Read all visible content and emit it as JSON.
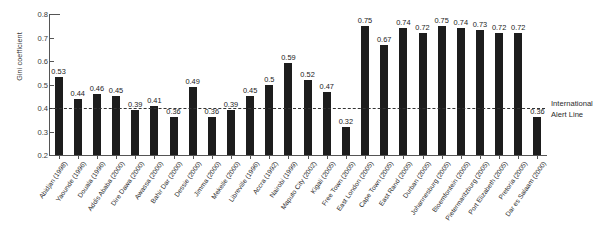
{
  "chart_data": {
    "type": "bar",
    "title": "",
    "xlabel": "",
    "ylabel": "Gini coefficient",
    "ylim": [
      0.2,
      0.8
    ],
    "ytick_labels": [
      "0.8",
      "0.7",
      "0.6",
      "0.5",
      "0.4",
      "0.3",
      "0.2"
    ],
    "ytick_values": [
      0.8,
      0.7,
      0.6,
      0.5,
      0.4,
      0.3,
      0.2
    ],
    "grid": false,
    "legend": "none",
    "bar_color": "#1d1d1d",
    "categories": [
      "Abidjan (1998)",
      "Yaounde (1996)",
      "Douala (1996)",
      "Addis Ababa (2000)",
      "Dire Dawa (2000)",
      "Awassa (2000)",
      "Bahir Dar (2000)",
      "Dessie (2000)",
      "Jimma (2000)",
      "Mekelle (2000)",
      "Libreville (1996)",
      "Accra (1992)",
      "Nairobi (1999)",
      "Maputo City (2002)",
      "Kigali (2005)",
      "Free Town (2005)",
      "East London (2005)",
      "Cape Town (2005)",
      "East Rand (2005)",
      "Durban (2005)",
      "Johannesburg (2005)",
      "Bloemfontein (2005)",
      "Pietermaritzburg (2005)",
      "Port Elizabeth (2005)",
      "Pretoria (2005)",
      "Dar es Salaam (2000)"
    ],
    "values": [
      0.53,
      0.44,
      0.46,
      0.45,
      0.39,
      0.41,
      0.36,
      0.49,
      0.36,
      0.39,
      0.45,
      0.5,
      0.59,
      0.52,
      0.47,
      0.32,
      0.75,
      0.67,
      0.74,
      0.72,
      0.75,
      0.74,
      0.73,
      0.72,
      0.72,
      0.36
    ],
    "value_labels": [
      "0.53",
      "0.44",
      "0.46",
      "0.45",
      "0.39",
      "0.41",
      "0.36",
      "0.49",
      "0.36",
      "0.39",
      "0.45",
      "0.5",
      "0.59",
      "0.52",
      "0.47",
      "0.32",
      "0.75",
      "0.67",
      "0.74",
      "0.72",
      "0.75",
      "0.74",
      "0.73",
      "0.72",
      "0.72",
      "0.36"
    ],
    "annotations": [
      {
        "name": "international-alert-line",
        "value": 0.4,
        "style": "dashed",
        "label_line1": "International",
        "label_line2": "Alert Line"
      }
    ]
  }
}
